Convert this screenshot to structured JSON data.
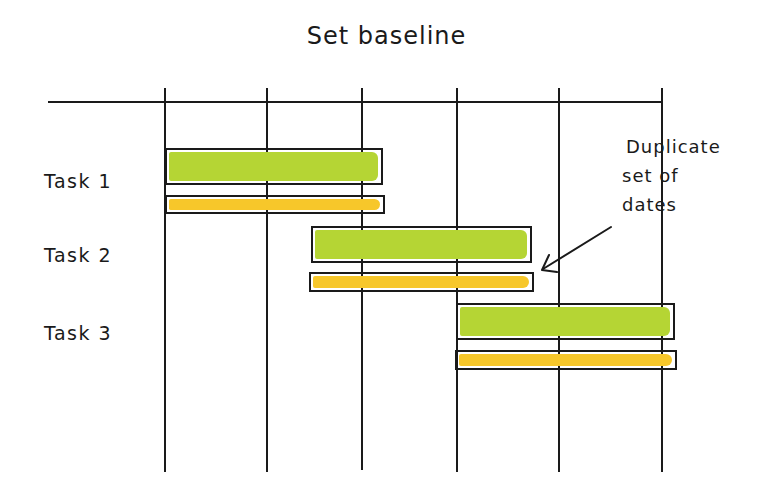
{
  "title": "Set baseline",
  "colors": {
    "line": "#1a1a1a",
    "planned": "#b5d534",
    "baseline": "#f7c72a",
    "background": "#ffffff"
  },
  "timeline": {
    "columns": 5,
    "gridline_x": [
      165,
      267,
      362,
      457,
      559,
      662
    ]
  },
  "tasks": [
    {
      "label": "Task 1",
      "start_col": 0,
      "end_col": 2.1
    },
    {
      "label": "Task 2",
      "start_col": 1.5,
      "end_col": 3.7
    },
    {
      "label": "Task 3",
      "start_col": 3.0,
      "end_col": 5.1
    }
  ],
  "annotation": {
    "lines": [
      "Duplicate",
      "set of",
      "dates"
    ],
    "points_to": "Task 2 baseline bar"
  },
  "legend_semantics": {
    "green_bar": "Current schedule",
    "yellow_bar": "Baseline (duplicate set of dates)"
  }
}
